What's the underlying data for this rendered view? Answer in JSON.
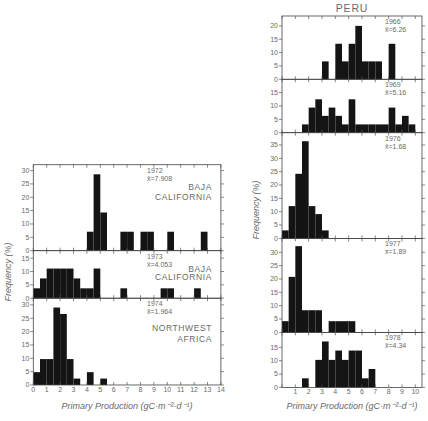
{
  "figure": {
    "left_panel_group": "Baja California / Northwest Africa",
    "right_panel_group": "Peru"
  },
  "chart_data": [
    {
      "id": "left",
      "type": "bar",
      "subtype": "stacked-panel histograms",
      "title": "",
      "xlabel": "Primary Production (gC·m⁻²·d⁻¹)",
      "ylabel": "Frequency (%)",
      "xlim": [
        0,
        14
      ],
      "xticks": [
        0,
        1,
        2,
        3,
        4,
        5,
        6,
        7,
        8,
        9,
        10,
        11,
        12,
        13,
        14
      ],
      "bin_width": 0.5,
      "grid": false,
      "legend": null,
      "panels": [
        {
          "year": "1972",
          "mean_label": "x̄=7.908",
          "location": [
            "BAJA",
            "CALIFORNIA"
          ],
          "ylim": [
            0,
            32.2
          ],
          "yticks": [
            0,
            5,
            10,
            15,
            20,
            25,
            30
          ],
          "bin_starts": [
            4.0,
            4.5,
            5.0,
            6.5,
            7.0,
            8.0,
            8.5,
            10.0,
            12.5
          ],
          "values": [
            7.1,
            28.6,
            14.3,
            7.1,
            7.1,
            7.1,
            7.1,
            7.1,
            7.1
          ]
        },
        {
          "year": "1973",
          "mean_label": "x̄=4.053",
          "location": [
            "BAJA",
            "CALIFORNIA"
          ],
          "ylim": [
            0,
            17.8
          ],
          "yticks": [
            0,
            5,
            10,
            15
          ],
          "bin_starts": [
            0.0,
            0.5,
            1.0,
            1.5,
            2.0,
            2.5,
            3.0,
            3.5,
            4.0,
            4.5,
            6.5,
            9.5,
            10.0,
            12.0
          ],
          "values": [
            3.7,
            7.4,
            11.1,
            11.1,
            11.1,
            11.1,
            7.4,
            3.7,
            3.7,
            11.1,
            3.7,
            3.7,
            3.7,
            3.7
          ]
        },
        {
          "year": "1974",
          "mean_label": "x̄=1.964",
          "location": [
            "NORTHWEST",
            "AFRICA"
          ],
          "ylim": [
            0,
            32.5
          ],
          "yticks": [
            0,
            5,
            10,
            15,
            20,
            25,
            30
          ],
          "bin_starts": [
            0.0,
            0.5,
            1.0,
            1.5,
            2.0,
            2.5,
            3.0,
            4.0,
            5.0
          ],
          "values": [
            4.8,
            9.7,
            9.7,
            29.0,
            26.6,
            9.7,
            2.4,
            4.8,
            2.4
          ]
        }
      ]
    },
    {
      "id": "right",
      "type": "bar",
      "subtype": "stacked-panel histograms",
      "title": "PERU",
      "xlabel": "Primary Production (gC·m⁻²·d⁻¹)",
      "ylabel": "Frequency (%)",
      "xlim": [
        0,
        10.5
      ],
      "xticks": [
        1,
        2,
        3,
        4,
        5,
        6,
        7,
        8,
        9,
        10
      ],
      "bin_width": 0.5,
      "grid": false,
      "legend": null,
      "panels": [
        {
          "year": "1966",
          "mean_label": "x̄=6.26",
          "location": [],
          "ylim": [
            0,
            23.7
          ],
          "yticks": [
            0,
            5,
            10,
            15,
            20
          ],
          "bin_starts": [
            3.0,
            4.0,
            4.5,
            5.0,
            5.5,
            6.0,
            6.5,
            7.0,
            8.0
          ],
          "values": [
            6.7,
            13.3,
            6.7,
            13.3,
            20.0,
            6.7,
            6.7,
            6.7,
            13.3
          ]
        },
        {
          "year": "1969",
          "mean_label": "x̄=5.16",
          "location": [],
          "ylim": [
            0,
            20.0
          ],
          "yticks": [
            0,
            5,
            10,
            15
          ],
          "bin_starts": [
            1.5,
            2.0,
            2.5,
            3.0,
            3.5,
            4.0,
            4.5,
            5.0,
            5.5,
            6.0,
            6.5,
            7.0,
            7.5,
            8.0,
            8.5,
            9.0,
            9.5
          ],
          "values": [
            3.1,
            9.4,
            12.5,
            6.3,
            9.4,
            6.3,
            3.1,
            12.5,
            3.1,
            3.1,
            3.1,
            3.1,
            3.1,
            9.4,
            3.1,
            6.3,
            3.1
          ]
        },
        {
          "year": "1976",
          "mean_label": "x̄=1.68",
          "location": [],
          "ylim": [
            0,
            39.6
          ],
          "yticks": [
            0,
            5,
            10,
            15,
            20,
            25,
            30,
            35
          ],
          "bin_starts": [
            0.0,
            0.5,
            1.0,
            1.5,
            2.0,
            2.5,
            3.0
          ],
          "values": [
            3.0,
            12.1,
            24.2,
            36.4,
            12.1,
            9.1,
            3.0
          ]
        },
        {
          "year": "1977",
          "mean_label": "x̄=1.89",
          "location": [],
          "ylim": [
            0,
            35.2
          ],
          "yticks": [
            0,
            5,
            10,
            15,
            20,
            25,
            30
          ],
          "bin_starts": [
            0.0,
            0.5,
            1.0,
            1.5,
            2.0,
            2.5,
            3.5,
            4.0,
            4.5,
            5.0
          ],
          "values": [
            4.2,
            20.8,
            32.3,
            8.3,
            8.3,
            8.3,
            4.2,
            4.2,
            4.2,
            4.2
          ]
        },
        {
          "year": "1978",
          "mean_label": "x̄=4.34",
          "location": [],
          "ylim": [
            0,
            20.6
          ],
          "yticks": [
            0,
            5,
            10,
            15
          ],
          "bin_starts": [
            1.5,
            2.5,
            3.0,
            3.5,
            4.0,
            4.5,
            5.0,
            5.5,
            6.0,
            6.5
          ],
          "values": [
            3.4,
            10.3,
            17.2,
            10.3,
            13.8,
            10.3,
            13.8,
            13.8,
            3.4,
            6.9
          ]
        }
      ]
    }
  ]
}
